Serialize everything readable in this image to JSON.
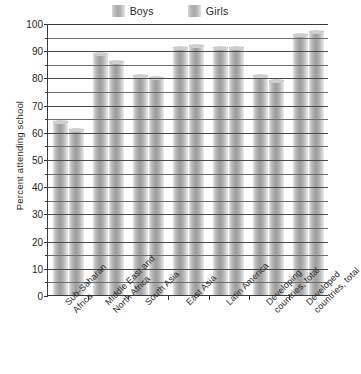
{
  "chart_data": {
    "type": "bar",
    "title": "",
    "xlabel": "",
    "ylabel": "Percent attending school",
    "ylim": [
      0,
      100
    ],
    "ytick_step": 10,
    "yticks": [
      0,
      10,
      20,
      30,
      40,
      50,
      60,
      70,
      80,
      90,
      100
    ],
    "grid": true,
    "legend_position": "top-center",
    "categories": [
      "Sub-Saharan Africa",
      "Middle East and North Africa",
      "South Asia",
      "East Asia",
      "Latin America",
      "Developing countries, total",
      "Developed countries, total"
    ],
    "series": [
      {
        "name": "Boys",
        "values": [
          64,
          89,
          81,
          91,
          91,
          81,
          96
        ]
      },
      {
        "name": "Girls",
        "values": [
          61,
          86,
          80,
          92,
          91,
          79,
          97
        ]
      }
    ]
  },
  "legend": {
    "entries": [
      {
        "label": "Boys"
      },
      {
        "label": "Girls"
      }
    ]
  },
  "axis": {
    "y_title": "Percent attending school"
  }
}
